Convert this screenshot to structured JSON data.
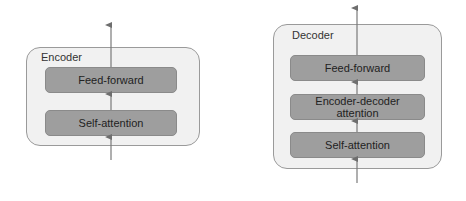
{
  "encoder": {
    "title": "Encoder",
    "layers": [
      "Feed-forward",
      "Self-attention"
    ]
  },
  "decoder": {
    "title": "Decoder",
    "layers": [
      "Feed-forward",
      "Encoder-decoder attention",
      "Self-attention"
    ]
  },
  "colors": {
    "container_bg": "#f1f1f1",
    "layer_bg": "#9e9e9e",
    "arrow": "#6e6e6e"
  }
}
